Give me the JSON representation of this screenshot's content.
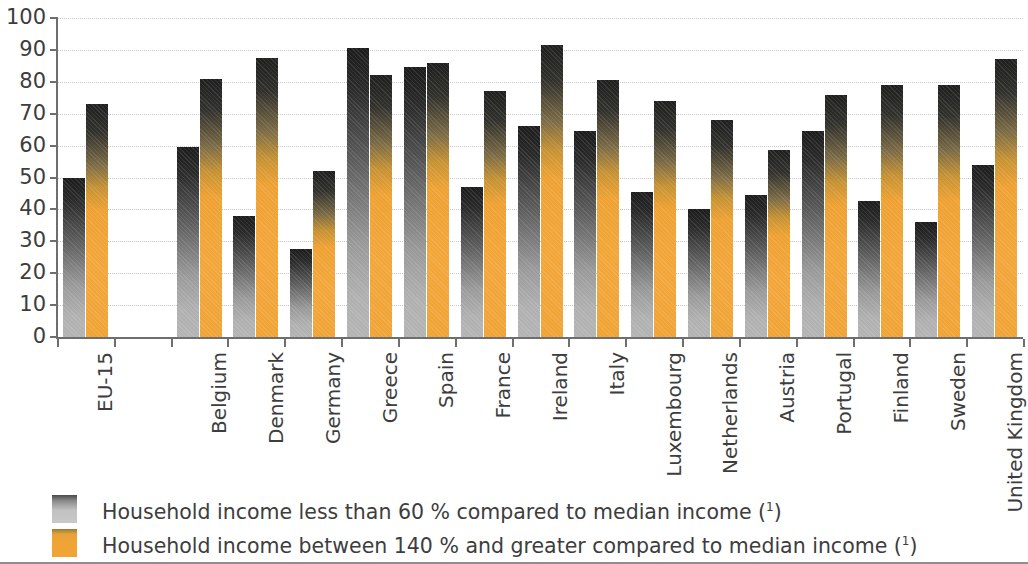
{
  "chart_data": {
    "type": "bar",
    "title": "",
    "subtitle": "",
    "xlabel": "",
    "ylabel": "",
    "ylim": [
      0,
      100
    ],
    "y_ticks": [
      0,
      10,
      20,
      30,
      40,
      50,
      60,
      70,
      80,
      90,
      100
    ],
    "grid": true,
    "legend_position": "bottom-left",
    "categories": [
      "EU-15",
      "Belgium",
      "Denmark",
      "Germany",
      "Greece",
      "Spain",
      "France",
      "Ireland",
      "Italy",
      "Luxembourg",
      "Netherlands",
      "Austria",
      "Portugal",
      "Finland",
      "Sweden",
      "United Kingdom"
    ],
    "series": [
      {
        "name": "Household income less than 60 % compared to median income (1)",
        "color": "#b4b4b4",
        "values": [
          50,
          59.5,
          38,
          27.5,
          90.5,
          84.5,
          47,
          66,
          64.5,
          45.5,
          40,
          44.5,
          64.5,
          42.5,
          36,
          54
        ]
      },
      {
        "name": "Household income between 140 % and greater compared to median income (1)",
        "color": "#f0a436",
        "values": [
          73,
          81,
          87.5,
          52,
          82,
          86,
          77,
          91.5,
          80.5,
          74,
          68,
          58.5,
          76,
          79,
          79,
          87
        ]
      }
    ]
  },
  "legend": {
    "items": [
      {
        "swatch": "gray",
        "label": "Household income less than 60 % compared to median income (",
        "footnote": "1",
        "label_end": ")"
      },
      {
        "swatch": "orange",
        "label": "Household income between 140 % and greater compared to median income (",
        "footnote": "1",
        "label_end": ")"
      }
    ]
  }
}
